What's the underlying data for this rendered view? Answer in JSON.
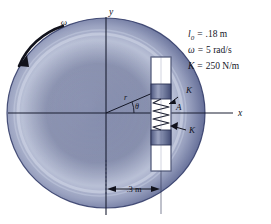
{
  "figure": {
    "name": "rotating-disk-spring-slider-diagram",
    "axes": {
      "y_label": "y",
      "x_label": "x"
    },
    "labels": {
      "omega": "ω",
      "radius": "r",
      "theta": "θ",
      "point_a": "A",
      "spring_k_upper": "K",
      "spring_k_lower": "K"
    },
    "dimension": {
      "value": ".3 m"
    },
    "legend": [
      {
        "symbol": "l",
        "subscript": "0",
        "equals": "=",
        "value": ".18 m"
      },
      {
        "symbol": "ω",
        "subscript": "",
        "equals": "=",
        "value": "5 rad/s"
      },
      {
        "symbol": "K",
        "subscript": "",
        "equals": "=",
        "value": "250 N/m"
      }
    ],
    "colors": {
      "disk_edge": "#3a4570",
      "disk_mid": "#8890b0",
      "disk_highlight": "#c3c9de",
      "slider_block": "#6b7496",
      "tube_fill": "#ffffff",
      "ink": "#12131c"
    }
  }
}
